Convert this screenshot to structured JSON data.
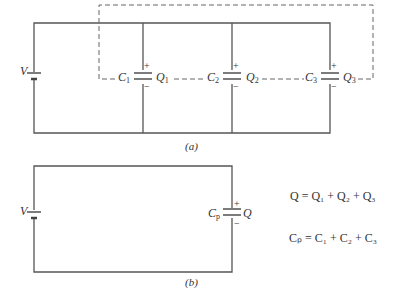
{
  "figure_a": {
    "caption": "(a)",
    "source_label": "V",
    "capacitors": [
      {
        "name": "C",
        "sub": "1",
        "charge": "Q",
        "charge_sub": "1",
        "plus": "+",
        "minus": "−"
      },
      {
        "name": "C",
        "sub": "2",
        "charge": "Q",
        "charge_sub": "2",
        "plus": "+",
        "minus": "−"
      },
      {
        "name": "C",
        "sub": "3",
        "charge": "Q",
        "charge_sub": "3",
        "plus": "+",
        "minus": "−"
      }
    ]
  },
  "figure_b": {
    "caption": "(b)",
    "source_label": "V",
    "capacitor": {
      "name": "C",
      "sub": "p",
      "charge": "Q",
      "plus": "+",
      "minus": "−"
    }
  },
  "equations": {
    "charge": "Q = Q₁ + Q₂ + Q₃",
    "capacitance": "Cₚ = C₁ + C₂ + C₃"
  }
}
